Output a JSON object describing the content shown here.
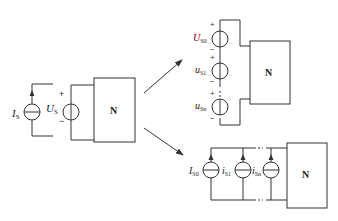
{
  "diagram": {
    "original": {
      "current_source": {
        "symbol": "I",
        "subscript": "S"
      },
      "voltage_source": {
        "symbol": "U",
        "subscript": "S",
        "plus": "+",
        "minus": "−"
      },
      "network_label": "N"
    },
    "voltage_series": {
      "sources": [
        {
          "symbol": "U",
          "subscript": "S0",
          "plus": "+",
          "minus": "−"
        },
        {
          "symbol": "u",
          "subscript": "S1",
          "plus": "+",
          "minus": "−"
        },
        {
          "symbol": "u",
          "subscript": "Sn",
          "plus": "+",
          "minus": "−"
        }
      ],
      "network_label": "N"
    },
    "current_parallel": {
      "sources": [
        {
          "symbol": "I",
          "subscript": "S0"
        },
        {
          "symbol": "i",
          "subscript": "S1"
        },
        {
          "symbol": "i",
          "subscript": "Sn"
        }
      ],
      "network_label": "N"
    },
    "arrows": [
      {
        "from": "original",
        "to": "voltage_series",
        "direction": "up-right"
      },
      {
        "from": "original",
        "to": "current_parallel",
        "direction": "down-right"
      }
    ]
  }
}
